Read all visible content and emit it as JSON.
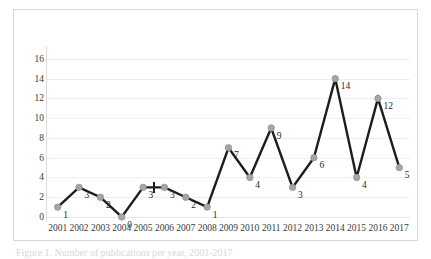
{
  "chart_data": {
    "type": "line",
    "title": "",
    "subtitle": "",
    "xlabel": "",
    "ylabel": "",
    "categories": [
      "2001",
      "2002",
      "2003",
      "2004",
      "2005",
      "2006",
      "2007",
      "2008",
      "2009",
      "2010",
      "2011",
      "2012",
      "2013",
      "2014",
      "2015",
      "2016",
      "2017"
    ],
    "values": [
      1,
      3,
      2,
      0,
      3,
      3,
      2,
      1,
      7,
      4,
      9,
      3,
      6,
      14,
      4,
      12,
      5
    ],
    "data_labels": [
      "1",
      "3",
      "2",
      "0",
      "3",
      "3",
      "2",
      "1",
      "7",
      "4",
      "9",
      "3",
      "6",
      "14",
      "4",
      "12",
      "5"
    ],
    "ylim": [
      0,
      17
    ],
    "y_ticks": [
      "0",
      "2",
      "4",
      "6",
      "8",
      "10",
      "12",
      "14",
      "16"
    ],
    "y_tick_values": [
      0,
      2,
      4,
      6,
      8,
      10,
      12,
      14,
      16
    ],
    "grid": true,
    "grid_orientation": "horizontal",
    "legend": false,
    "legend_position": "none",
    "series": [
      {
        "name": "",
        "values": [
          1,
          3,
          2,
          0,
          3,
          3,
          2,
          1,
          7,
          4,
          9,
          3,
          6,
          14,
          4,
          12,
          5
        ]
      }
    ]
  },
  "style": {
    "line_color": "#1d1d1d",
    "marker_color": "#a6a6a6",
    "marker_edge_color": "#8f8f8f",
    "grid_color": "#eceff1",
    "axis_color": "#dcdcdc",
    "frame_border_color": "#d8d8d8",
    "tick_label_color": "#3a3a3a",
    "data_label_color": "#2b2b2b",
    "background": "#ffffff"
  },
  "overlay": {
    "cursor_icon": "crosshair-cursor"
  },
  "caption": {
    "text": "Figure 1. Number of publications per year, 2001-2017"
  }
}
